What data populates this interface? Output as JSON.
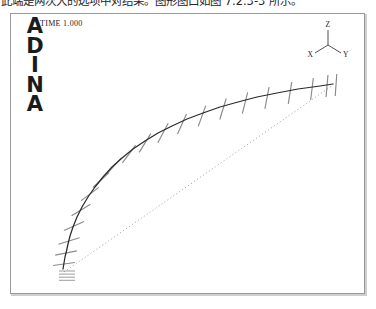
{
  "caption": {
    "text": "此端是两次大的选项中对结果。图形图口如图 7.2.3-3 所示。"
  },
  "plot": {
    "logo_letters": [
      "A",
      "D",
      "I",
      "N",
      "A"
    ],
    "time_label": "TIME 1.000",
    "axis_triad": {
      "z_label": "Z",
      "x_label": "X",
      "y_label": "Y"
    },
    "colors": {
      "frame_border": "#9a9a9a",
      "deformed_curve": "#2b2b2b",
      "cross_section_tick": "#8a8a8a",
      "undeformed_line": "#8e8e8e",
      "support_hatch": "#7a7a7a",
      "text": "#1c1c1c"
    }
  },
  "chart_data": {
    "type": "line",
    "xlabel": "",
    "ylabel": "",
    "grid": false,
    "legend": null,
    "xlim": [
      0,
      353
    ],
    "ylim": [
      0,
      279
    ],
    "series": [
      {
        "name": "deformed-beam-curve",
        "style": "solid",
        "color": "#2b2b2b",
        "points": [
          [
            52,
            255
          ],
          [
            53,
            249
          ],
          [
            54,
            243
          ],
          [
            55.5,
            237
          ],
          [
            57,
            230
          ],
          [
            59,
            222
          ],
          [
            62,
            213
          ],
          [
            66,
            203
          ],
          [
            71,
            193
          ],
          [
            77,
            183
          ],
          [
            84,
            173
          ],
          [
            92,
            163
          ],
          [
            101,
            153
          ],
          [
            111,
            144
          ],
          [
            122,
            135
          ],
          [
            134,
            127
          ],
          [
            147,
            119
          ],
          [
            161,
            112
          ],
          [
            176,
            105
          ],
          [
            192,
            99
          ],
          [
            209,
            93
          ],
          [
            227,
            88
          ],
          [
            246,
            83
          ],
          [
            266,
            79
          ],
          [
            287,
            75
          ],
          [
            309,
            72
          ],
          [
            322,
            70
          ]
        ]
      },
      {
        "name": "undeformed-beam-line",
        "style": "dotted",
        "color": "#8e8e8e",
        "points": [
          [
            53,
            258
          ],
          [
            322,
            71
          ]
        ]
      }
    ],
    "cross_section_ticks": [
      {
        "x": 53,
        "y": 250,
        "angle": 82
      },
      {
        "x": 55,
        "y": 239,
        "angle": 79
      },
      {
        "x": 58,
        "y": 227,
        "angle": 73
      },
      {
        "x": 63,
        "y": 212,
        "angle": 66
      },
      {
        "x": 70,
        "y": 196,
        "angle": 59
      },
      {
        "x": 79,
        "y": 180,
        "angle": 53
      },
      {
        "x": 90,
        "y": 166,
        "angle": 47
      },
      {
        "x": 103,
        "y": 152,
        "angle": 42
      },
      {
        "x": 118,
        "y": 140,
        "angle": 37
      },
      {
        "x": 134,
        "y": 129,
        "angle": 32
      },
      {
        "x": 152,
        "y": 119,
        "angle": 28
      },
      {
        "x": 171,
        "y": 110,
        "angle": 24
      },
      {
        "x": 191,
        "y": 102,
        "angle": 20
      },
      {
        "x": 212,
        "y": 95,
        "angle": 17
      },
      {
        "x": 234,
        "y": 89,
        "angle": 14
      },
      {
        "x": 256,
        "y": 84,
        "angle": 11
      },
      {
        "x": 279,
        "y": 79,
        "angle": 9
      },
      {
        "x": 301,
        "y": 75,
        "angle": 7
      },
      {
        "x": 316,
        "y": 72,
        "angle": 5
      },
      {
        "x": 325,
        "y": 71,
        "angle": 4
      }
    ],
    "support": {
      "x": 52,
      "y": 258,
      "hatch_lines": 4,
      "width": 16
    },
    "annotations": [
      {
        "name": "time-step",
        "text": "TIME 1.000",
        "x": 29,
        "y": 9
      },
      {
        "name": "axis-z",
        "text": "Z",
        "x": 333,
        "y": 9
      },
      {
        "name": "axis-x",
        "text": "X",
        "x": 316,
        "y": 36
      },
      {
        "name": "axis-y",
        "text": "Y",
        "x": 351,
        "y": 37
      }
    ]
  }
}
